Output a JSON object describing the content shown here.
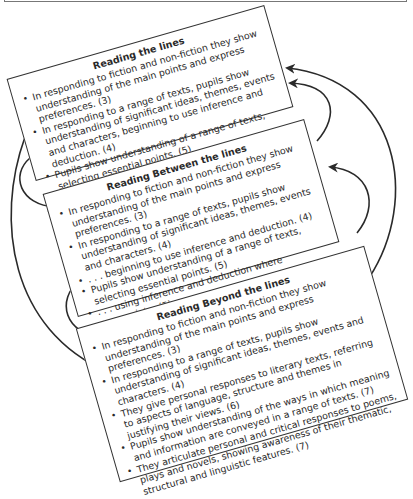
{
  "diagram": {
    "type": "nested-overlapping-boxes-with-feedback-arrows",
    "boxes": [
      {
        "id": "reading-the-lines",
        "title": "Reading the lines",
        "items": [
          "In responding to fiction and non-fiction they show understanding of the main points and express preferences. (3)",
          "In responding to a range of texts, pupils show understanding of significant ideas, themes, events and characters, beginning to use inference and deduction. (4)",
          "Pupils show understanding of a range of texts, selecting essential points. (5)"
        ]
      },
      {
        "id": "reading-between-the-lines",
        "title": "Reading Between the lines",
        "items": [
          "In responding to fiction and non-fiction they show understanding of the main points and express preferences. (3)",
          "In responding to a range of texts, pupils show understanding of significant ideas, themes, events and characters. (4)",
          ". . . beginning to use inference and deduction. (4)",
          "Pupils show understanding of a range of texts, selecting essential points. (5)",
          ". . . using inference and deduction where appropriate. (5)",
          "In reading and discussing a range of texts, pupils identify different layers of meaning and comment on their significance and effect. (6)"
        ]
      },
      {
        "id": "reading-beyond-the-lines",
        "title": "Reading Beyond the lines",
        "items": [
          "In responding to fiction and non-fiction they show understanding of the main points and express preferences. (3)",
          "In responding to a range of texts, pupils show understanding of significant ideas, themes, events and characters. (4)",
          "They give personal responses to literary texts, referring to aspects of language, structure and themes in justifying their views. (6)",
          "Pupils show understanding of the ways in which meaning and information are conveyed in a range of texts. (7)",
          "They articulate personal and critical responses to poems, plays and novels, showing awareness of their thematic, structural and linguistic features. (7)"
        ]
      }
    ],
    "arrows": [
      {
        "from": "reading-the-lines",
        "to": "reading-between-the-lines",
        "side": "left"
      },
      {
        "from": "reading-between-the-lines",
        "to": "reading-beyond-the-lines",
        "side": "left"
      },
      {
        "from": "reading-the-lines",
        "to": "reading-beyond-the-lines",
        "side": "left"
      },
      {
        "from": "reading-between-the-lines",
        "to": "reading-the-lines",
        "side": "right"
      },
      {
        "from": "reading-beyond-the-lines",
        "to": "reading-between-the-lines",
        "side": "right"
      },
      {
        "from": "reading-beyond-the-lines",
        "to": "reading-the-lines",
        "side": "right"
      }
    ],
    "colors": {
      "line": "#2a2a2a",
      "box_border": "#333333",
      "background": "#ffffff",
      "frame": "#777777"
    }
  }
}
